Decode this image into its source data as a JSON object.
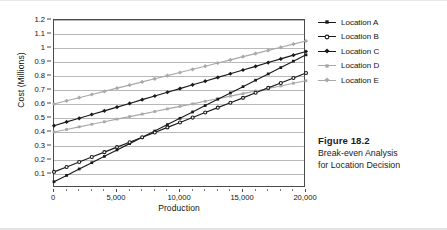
{
  "caption": {
    "title": "Figure 18.2",
    "line1": "Break-even Analysis",
    "line2": "for Location Decision"
  },
  "legend": {
    "position": "right",
    "entries": [
      {
        "label": "Location A",
        "color": "#1a1a1a",
        "marker": "filled-square-marker"
      },
      {
        "label": "Location B",
        "color": "#1a1a1a",
        "marker": "open-circle-marker"
      },
      {
        "label": "Location C",
        "color": "#1a1a1a",
        "marker": "filled-diamond-marker"
      },
      {
        "label": "Location D",
        "color": "#a8a8a8",
        "marker": "filled-square-marker"
      },
      {
        "label": "Location E",
        "color": "#a8a8a8",
        "marker": "filled-diamond-marker"
      }
    ]
  },
  "chart_data": {
    "type": "line",
    "title": "",
    "xlabel": "Production",
    "ylabel": "Cost (Millions)",
    "xlim": [
      0,
      20000
    ],
    "ylim": [
      0,
      1.2
    ],
    "grid": true,
    "legend_position": "right",
    "x_tick_labels": [
      "0",
      "5,000",
      "10,000",
      "15,000",
      "20,000"
    ],
    "x_ticks": [
      0,
      5000,
      10000,
      15000,
      20000
    ],
    "x_minor_tick_step": 1000,
    "y_tick_labels": [
      "0.1",
      "0.2",
      "0.3",
      "0.4",
      "0.5",
      "0.6",
      "0.7",
      "0.8",
      "0.9",
      "1",
      "1.1",
      "1.2"
    ],
    "y_ticks": [
      0.1,
      0.2,
      0.3,
      0.4,
      0.5,
      0.6,
      0.7,
      0.8,
      0.9,
      1.0,
      1.1,
      1.2
    ],
    "x": [
      0,
      1000,
      2000,
      3000,
      4000,
      5000,
      6000,
      7000,
      8000,
      9000,
      10000,
      11000,
      12000,
      13000,
      14000,
      15000,
      16000,
      17000,
      18000,
      19000,
      20000
    ],
    "series": [
      {
        "name": "Location A",
        "color": "#1a1a1a",
        "marker": "filled-square-marker",
        "fixed_cost": 0.045,
        "variable_cost_per_unit": 4.53e-05,
        "values": [
          0.045,
          0.09,
          0.136,
          0.181,
          0.226,
          0.272,
          0.317,
          0.362,
          0.407,
          0.453,
          0.498,
          0.543,
          0.589,
          0.634,
          0.679,
          0.724,
          0.77,
          0.815,
          0.86,
          0.906,
          0.951
        ]
      },
      {
        "name": "Location B",
        "color": "#1a1a1a",
        "marker": "open-circle-marker",
        "fixed_cost": 0.115,
        "variable_cost_per_unit": 3.53e-05,
        "values": [
          0.115,
          0.15,
          0.186,
          0.221,
          0.256,
          0.292,
          0.327,
          0.362,
          0.397,
          0.433,
          0.468,
          0.503,
          0.539,
          0.574,
          0.609,
          0.644,
          0.68,
          0.715,
          0.75,
          0.786,
          0.821
        ]
      },
      {
        "name": "Location C",
        "color": "#1a1a1a",
        "marker": "filled-diamond-marker",
        "fixed_cost": 0.445,
        "variable_cost_per_unit": 2.65e-05,
        "values": [
          0.445,
          0.472,
          0.498,
          0.525,
          0.551,
          0.578,
          0.604,
          0.631,
          0.657,
          0.684,
          0.71,
          0.737,
          0.763,
          0.79,
          0.816,
          0.843,
          0.869,
          0.896,
          0.922,
          0.949,
          0.975
        ]
      },
      {
        "name": "Location D",
        "color": "#a8a8a8",
        "marker": "filled-square-marker",
        "fixed_cost": 0.4,
        "variable_cost_per_unit": 1.83e-05,
        "values": [
          0.4,
          0.418,
          0.437,
          0.455,
          0.473,
          0.492,
          0.51,
          0.528,
          0.546,
          0.565,
          0.583,
          0.601,
          0.62,
          0.638,
          0.656,
          0.674,
          0.693,
          0.711,
          0.729,
          0.748,
          0.766
        ]
      },
      {
        "name": "Location E",
        "color": "#a8a8a8",
        "marker": "filled-diamond-marker",
        "fixed_cost": 0.6,
        "variable_cost_per_unit": 2.25e-05,
        "values": [
          0.6,
          0.623,
          0.645,
          0.668,
          0.69,
          0.713,
          0.735,
          0.758,
          0.78,
          0.803,
          0.825,
          0.848,
          0.87,
          0.893,
          0.915,
          0.938,
          0.96,
          0.983,
          1.005,
          1.028,
          1.05
        ]
      }
    ]
  }
}
